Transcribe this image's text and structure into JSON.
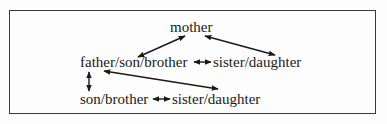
{
  "diagram": {
    "type": "kinship-relations",
    "nodes": {
      "mother": "mother",
      "father_son_brother": "father/son/brother",
      "sister_daughter_mid": "sister/daughter",
      "son_brother": "son/brother",
      "sister_daughter_bottom": "sister/daughter"
    },
    "edges": [
      {
        "from": "mother",
        "to": "father/son/brother",
        "style": "double-arrow"
      },
      {
        "from": "mother",
        "to": "sister/daughter (middle)",
        "style": "double-arrow"
      },
      {
        "from": "father/son/brother",
        "to": "sister/daughter (middle)",
        "style": "short double-arrow"
      },
      {
        "from": "father/son/brother",
        "to": "son/brother",
        "style": "vertical double-arrow"
      },
      {
        "from": "father/son/brother",
        "to": "sister/daughter (bottom)",
        "style": "double-arrow"
      },
      {
        "from": "son/brother",
        "to": "sister/daughter (bottom)",
        "style": "short double-arrow"
      }
    ],
    "colors": {
      "line": "#1a1a1a",
      "border": "#3a3a3a",
      "background": "#fdfdfd"
    }
  }
}
